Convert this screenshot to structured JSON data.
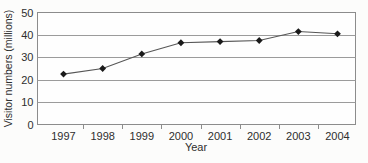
{
  "chart_data": {
    "type": "line",
    "categories": [
      "1997",
      "1998",
      "1999",
      "2000",
      "2001",
      "2002",
      "2003",
      "2004"
    ],
    "series": [
      {
        "name": "Visitor numbers",
        "values": [
          22.5,
          25,
          31.5,
          36.5,
          37,
          37.5,
          41.5,
          40.5
        ]
      }
    ],
    "title": "",
    "xlabel": "Year",
    "ylabel": "Visitor numbers (millions)",
    "ylim": [
      0,
      50
    ],
    "yticks": [
      0,
      10,
      20,
      30,
      40,
      50
    ],
    "grid": "horizontal",
    "legend": "none",
    "marker": "diamond"
  },
  "colors": {
    "text": "#2e2e2e",
    "gridline": "#9b9b9b",
    "plot_border": "#8c8c8c",
    "series_line": "#565656",
    "marker_fill": "#1a1a1a",
    "plot_background": "#fefefe",
    "page_background": "#fcfcfb"
  }
}
